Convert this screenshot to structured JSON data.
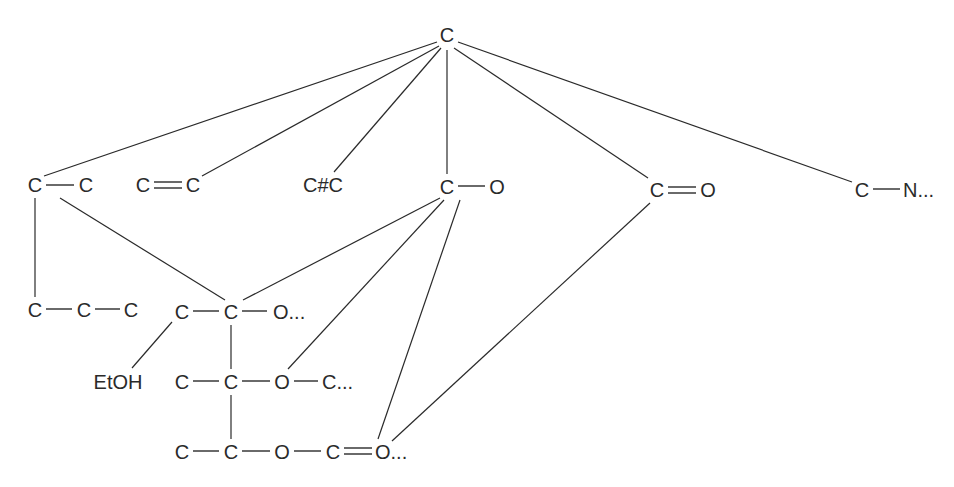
{
  "diagram": {
    "type": "molecular-fragment-tree",
    "colors": {
      "ink": "#2a2a2a",
      "background": "#ffffff"
    },
    "root": {
      "label": "C"
    },
    "level1": [
      {
        "id": "n_cc",
        "atoms": [
          "C",
          "C"
        ],
        "bond": "single"
      },
      {
        "id": "n_c2c",
        "atoms": [
          "C",
          "C"
        ],
        "bond": "double"
      },
      {
        "id": "n_c3c",
        "label": "C#C"
      },
      {
        "id": "n_co",
        "atoms": [
          "C",
          "O"
        ],
        "bond": "single"
      },
      {
        "id": "n_c2o",
        "atoms": [
          "C",
          "O"
        ],
        "bond": "double"
      },
      {
        "id": "n_cn",
        "atoms": [
          "C",
          "N..."
        ],
        "bond": "single"
      }
    ],
    "level2": [
      {
        "id": "n_ccc",
        "atoms": [
          "C",
          "C",
          "C"
        ],
        "bonds": [
          "single",
          "single"
        ]
      },
      {
        "id": "n_cco",
        "atoms": [
          "C",
          "C",
          "O..."
        ],
        "bonds": [
          "single",
          "single"
        ]
      },
      {
        "id": "n_etoh",
        "label": "EtOH"
      },
      {
        "id": "n_ccoc",
        "atoms": [
          "C",
          "C",
          "O",
          "C..."
        ],
        "bonds": [
          "single",
          "single",
          "single"
        ]
      },
      {
        "id": "n_ccoco",
        "atoms": [
          "C",
          "C",
          "O",
          "C",
          "O..."
        ],
        "bonds": [
          "single",
          "single",
          "single",
          "double"
        ]
      }
    ],
    "edges": [
      [
        "root",
        "n_cc"
      ],
      [
        "root",
        "n_c2c"
      ],
      [
        "root",
        "n_c3c"
      ],
      [
        "root",
        "n_co"
      ],
      [
        "root",
        "n_c2o"
      ],
      [
        "root",
        "n_cn"
      ],
      [
        "n_cc",
        "n_ccc"
      ],
      [
        "n_cc",
        "n_cco"
      ],
      [
        "n_co",
        "n_cco"
      ],
      [
        "n_co",
        "n_ccoc"
      ],
      [
        "n_co",
        "n_ccoco"
      ],
      [
        "n_c2o",
        "n_ccoco"
      ],
      [
        "n_cco",
        "n_etoh"
      ],
      [
        "n_cco",
        "n_ccoc"
      ],
      [
        "n_ccoc",
        "n_ccoco"
      ]
    ]
  }
}
